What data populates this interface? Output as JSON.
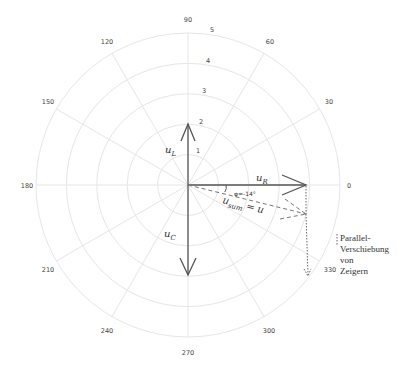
{
  "diagram": {
    "type": "polar phasor diagram",
    "angle_ticks": [
      "0",
      "30",
      "60",
      "90",
      "120",
      "150",
      "180",
      "210",
      "240",
      "270",
      "300",
      "330"
    ],
    "radial_ticks": [
      "1",
      "2",
      "3",
      "4",
      "5"
    ],
    "phasors": {
      "u_L": {
        "base": "u",
        "sub": "L",
        "angle_deg": 90,
        "magnitude": 2
      },
      "u_R": {
        "base": "u",
        "sub": "R",
        "angle_deg": 0,
        "magnitude": 3.8
      },
      "u_C": {
        "base": "u",
        "sub": "C",
        "angle_deg": 270,
        "magnitude": 2.8
      },
      "u_sum": {
        "base": "u",
        "sub": "sum",
        "suffix": " = u",
        "angle_deg": -14,
        "magnitude": 3.9
      }
    },
    "angle_annotation": "φ=-14°",
    "note_lines": [
      "Parallel-",
      "Verschiebung",
      "von",
      "Zeigern"
    ],
    "colors": {
      "grid": "#e6e6e6",
      "phasor": "#555555",
      "text": "#333333"
    }
  }
}
